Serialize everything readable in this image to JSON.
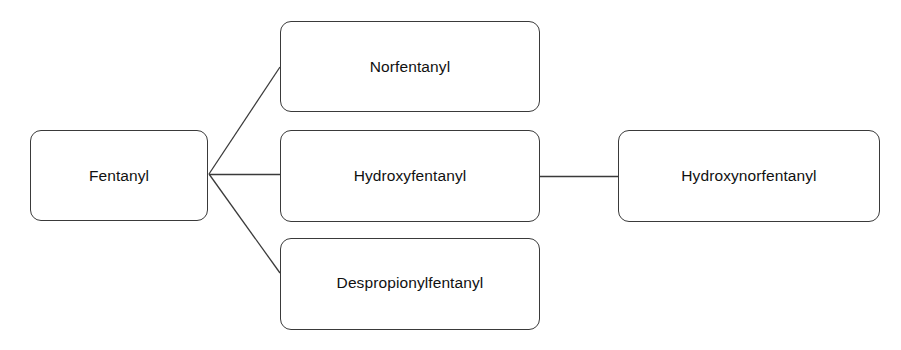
{
  "diagram": {
    "type": "metabolic-pathway-flowchart",
    "background_color": "#ffffff",
    "stroke_color": "#3a3a3a",
    "text_color": "#111111",
    "nodes": [
      {
        "id": "fentanyl",
        "label": "Fentanyl"
      },
      {
        "id": "norfentanyl",
        "label": "Norfentanyl"
      },
      {
        "id": "hydroxyfentanyl",
        "label": "Hydroxyfentanyl"
      },
      {
        "id": "despropionylfentanyl",
        "label": "Despropionylfentanyl"
      },
      {
        "id": "hydroxynorfentanyl",
        "label": "Hydroxynorfentanyl"
      }
    ],
    "edges": [
      {
        "id": "edge-fentanyl-norfentanyl",
        "from": "fentanyl",
        "to": "norfentanyl",
        "shape": "diagonal-up"
      },
      {
        "id": "edge-fentanyl-hydroxyfentanyl",
        "from": "fentanyl",
        "to": "hydroxyfentanyl",
        "shape": "horizontal"
      },
      {
        "id": "edge-fentanyl-despropionylfentanyl",
        "from": "fentanyl",
        "to": "despropionylfentanyl",
        "shape": "diagonal-down"
      },
      {
        "id": "edge-hydroxyfentanyl-hydroxynorfentanyl",
        "from": "hydroxyfentanyl",
        "to": "hydroxynorfentanyl",
        "shape": "horizontal"
      }
    ]
  }
}
